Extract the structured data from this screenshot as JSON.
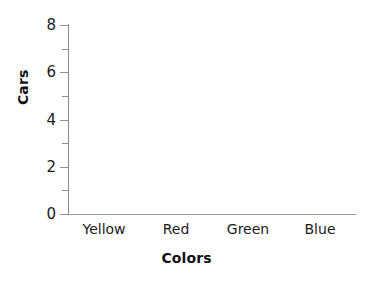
{
  "chart_data": {
    "type": "bar",
    "title": "",
    "subtitle": "",
    "xlabel": "Colors",
    "ylabel": "Cars",
    "categories": [
      "Yellow",
      "Red",
      "Green",
      "Blue"
    ],
    "values": [
      0,
      0,
      0,
      0
    ],
    "series": [
      {
        "name": "Cars",
        "values": [
          0,
          0,
          0,
          0
        ]
      }
    ],
    "ylim": [
      0,
      8
    ],
    "y_major_ticks": [
      0,
      2,
      4,
      6,
      8
    ],
    "y_major_tick_labels": [
      "0",
      "2",
      "4",
      "6",
      "8"
    ],
    "y_minor_ticks": [
      1,
      3,
      5,
      7
    ],
    "x_ticks_visible": false,
    "grid": false,
    "legend": false,
    "legend_position": "none",
    "annotations": [],
    "note": "empty bar chart template with no plotted bars",
    "colors": {
      "background": "#ffffff",
      "axis_line": "#8c8c8c",
      "x_axis_line": "#9a9a9a",
      "tick_mark": "#8c8c8c",
      "tick_label_text": "#1a1a1a",
      "axis_title_text": "#111111"
    }
  },
  "axes": {
    "y": {
      "label": "Cars",
      "tick_labels": [
        "8",
        "6",
        "4",
        "2",
        "0"
      ]
    },
    "x": {
      "label": "Colors",
      "tick_labels": [
        "Yellow",
        "Red",
        "Green",
        "Blue"
      ]
    }
  }
}
